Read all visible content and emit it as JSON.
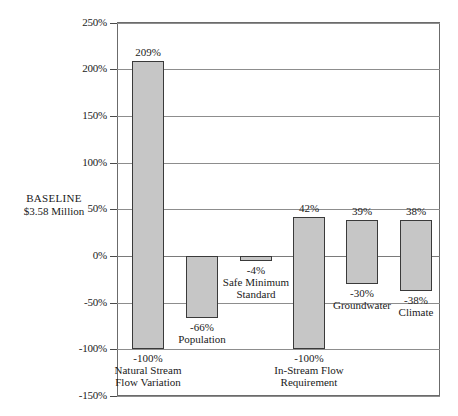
{
  "annotation": {
    "baseline_line1": "BASELINE",
    "baseline_line2": "$3.58 Million"
  },
  "chart_data": {
    "type": "bar",
    "title": "",
    "subtitle": "",
    "xlabel": "",
    "ylabel": "",
    "ylim": [
      -150,
      250
    ],
    "ytick_labels": [
      "250%",
      "200%",
      "150%",
      "100%",
      "50%",
      "0%",
      "-50%",
      "-100%",
      "-150%"
    ],
    "ytick_values": [
      250,
      200,
      150,
      100,
      50,
      0,
      -50,
      -100,
      -150
    ],
    "grid": true,
    "legend": "none",
    "baseline_value": 0,
    "annotations": [
      "BASELINE",
      "$3.58 Million"
    ],
    "categories": [
      "Natural Stream Flow Variation",
      "Population",
      "Safe Minimum Standard",
      "In-Stream Flow Requirement",
      "Groundwater",
      "Climate"
    ],
    "series": [
      {
        "name": "High",
        "values": [
          209,
          0,
          0,
          42,
          39,
          38
        ]
      },
      {
        "name": "Low",
        "values": [
          -100,
          -66,
          -4,
          -100,
          -30,
          -38
        ]
      }
    ],
    "bars": [
      {
        "category_line1": "Natural Stream",
        "category_line2": "Flow Variation",
        "high": 209,
        "low": -100,
        "high_label": "209%",
        "low_label": "-100%"
      },
      {
        "category_line1": "Population",
        "category_line2": "",
        "high": 0,
        "low": -66,
        "high_label": "",
        "low_label": "-66%"
      },
      {
        "category_line1": "Safe Minimum",
        "category_line2": "Standard",
        "high": 0,
        "low": -4,
        "high_label": "",
        "low_label": "-4%"
      },
      {
        "category_line1": "In-Stream Flow",
        "category_line2": "Requirement",
        "high": 42,
        "low": -100,
        "high_label": "42%",
        "low_label": "-100%"
      },
      {
        "category_line1": "Groundwater",
        "category_line2": "",
        "high": 39,
        "low": -30,
        "high_label": "39%",
        "low_label": "-30%"
      },
      {
        "category_line1": "Climate",
        "category_line2": "",
        "high": 38,
        "low": -38,
        "high_label": "38%",
        "low_label": "-38%"
      }
    ],
    "colors": {
      "bar_fill": "#c6c6c6",
      "bar_border": "#3a3a3a",
      "grid": "#8d8d8d",
      "frame": "#6b6b6b",
      "text": "#1a1a1a"
    }
  }
}
